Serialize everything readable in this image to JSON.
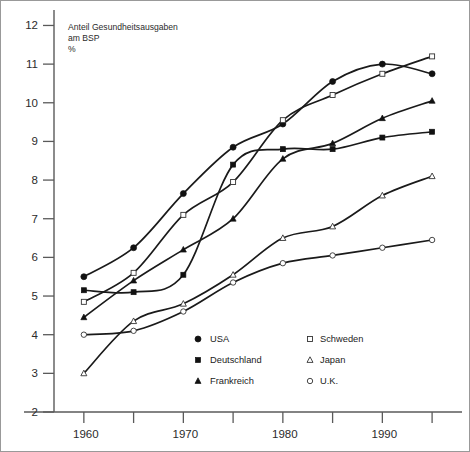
{
  "chart_data": {
    "type": "line",
    "title": "",
    "ylabel": "Anteil Gesundheitsausgaben am BSP %",
    "ylabel_lines": [
      "Anteil Gesundheitsausgaben",
      "am BSP",
      "%"
    ],
    "xlabel": "",
    "x": [
      1960,
      1965,
      1970,
      1975,
      1980,
      1985,
      1990,
      1995
    ],
    "xlim": [
      1957,
      1997
    ],
    "ylim": [
      2,
      12.4
    ],
    "xticks": [
      1960,
      1965,
      1970,
      1975,
      1980,
      1985,
      1990,
      1995
    ],
    "xtick_labels": [
      "1960",
      "",
      "1970",
      "",
      "1980",
      "",
      "1990",
      ""
    ],
    "yticks": [
      2,
      3,
      4,
      5,
      6,
      7,
      8,
      9,
      10,
      11,
      12
    ],
    "ytick_labels": [
      "2",
      "3",
      "4",
      "5",
      "6",
      "7",
      "8",
      "9",
      "10",
      "11",
      "12"
    ],
    "grid": false,
    "legend_position": "bottom-right",
    "series": [
      {
        "name": "USA",
        "marker": "filled-circle",
        "values": [
          5.5,
          6.25,
          7.65,
          8.85,
          9.45,
          10.55,
          11.0,
          10.75
        ]
      },
      {
        "name": "Deutschland",
        "marker": "filled-square",
        "values": [
          5.15,
          5.1,
          5.55,
          8.4,
          8.8,
          8.8,
          9.1,
          9.25
        ]
      },
      {
        "name": "Frankreich",
        "marker": "filled-triangle",
        "values": [
          4.45,
          5.4,
          6.2,
          7.0,
          8.55,
          8.95,
          9.6,
          10.05
        ]
      },
      {
        "name": "Schweden",
        "marker": "open-square",
        "values": [
          4.85,
          5.6,
          7.1,
          7.95,
          9.55,
          10.2,
          10.75,
          11.2
        ]
      },
      {
        "name": "Japan",
        "marker": "open-triangle",
        "values": [
          3.0,
          4.35,
          4.8,
          5.55,
          6.5,
          6.8,
          7.6,
          8.1
        ]
      },
      {
        "name": "U.K.",
        "marker": "open-circle",
        "values": [
          4.0,
          4.1,
          4.6,
          5.35,
          5.85,
          6.05,
          6.25,
          6.45
        ]
      }
    ]
  },
  "legend": {
    "column_left": [
      "USA",
      "Deutschland",
      "Frankreich"
    ],
    "column_right": [
      "Schweden",
      "Japan",
      "U.K."
    ]
  },
  "colors": {
    "ink": "#1a1a1a",
    "axis": "#5a5a5a",
    "frame": "#999999",
    "background": "#ffffff"
  }
}
